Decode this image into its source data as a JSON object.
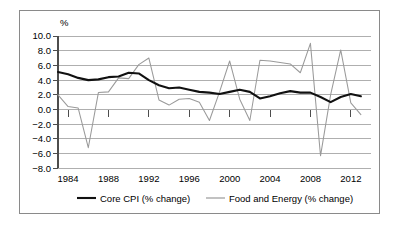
{
  "chart_data": {
    "type": "line",
    "title": "",
    "xlabel": "",
    "ylabel": "%",
    "y_unit_label": "%",
    "xlim": [
      1983,
      2014
    ],
    "ylim": [
      -8.0,
      10.0
    ],
    "grid": true,
    "legend_position": "bottom",
    "x_tick_labels": [
      "1984",
      "1988",
      "1992",
      "1996",
      "2000",
      "2004",
      "2008",
      "2012"
    ],
    "x_tick_values": [
      1984,
      1988,
      1992,
      1996,
      2000,
      2004,
      2008,
      2012
    ],
    "y_tick_labels": [
      "10.0",
      "8.0",
      "6.0",
      "4.0",
      "2.0",
      "0.0",
      "−2.0",
      "−4.0",
      "−6.0",
      "−8.0"
    ],
    "y_tick_values": [
      10.0,
      8.0,
      6.0,
      4.0,
      2.0,
      0.0,
      -2.0,
      -4.0,
      -6.0,
      -8.0
    ],
    "x": [
      1983,
      1984,
      1985,
      1986,
      1987,
      1988,
      1989,
      1990,
      1991,
      1992,
      1993,
      1994,
      1995,
      1996,
      1997,
      1998,
      1999,
      2000,
      2001,
      2002,
      2003,
      2004,
      2005,
      2006,
      2007,
      2008,
      2009,
      2010,
      2011,
      2012,
      2013
    ],
    "series": [
      {
        "name": "Core CPI (% change)",
        "color": "#111111",
        "style": "thick-black",
        "values": [
          5.1,
          4.8,
          4.3,
          4.0,
          4.1,
          4.4,
          4.5,
          5.0,
          4.9,
          4.0,
          3.3,
          2.9,
          3.0,
          2.7,
          2.4,
          2.3,
          2.1,
          2.4,
          2.7,
          2.4,
          1.5,
          1.8,
          2.2,
          2.5,
          2.3,
          2.3,
          1.7,
          1.0,
          1.7,
          2.1,
          1.8
        ]
      },
      {
        "name": "Food and Energy (% change)",
        "color": "#9a9a9a",
        "style": "thin-gray",
        "values": [
          2.0,
          0.4,
          0.2,
          -5.2,
          2.3,
          2.4,
          4.3,
          4.2,
          6.1,
          7.0,
          1.3,
          0.6,
          1.4,
          1.5,
          1.0,
          -1.5,
          2.4,
          6.6,
          1.4,
          -1.5,
          6.7,
          6.6,
          6.4,
          6.2,
          5.0,
          9.0,
          -6.3,
          2.0,
          8.1,
          0.9,
          -0.7
        ]
      }
    ],
    "legend": [
      {
        "label": "Core CPI (% change)",
        "color": "#111111"
      },
      {
        "label": "Food and Energy (% change)",
        "color": "#9a9a9a"
      }
    ]
  },
  "axes": {
    "y_unit": "%",
    "y_labels": {
      "t0": "10.0",
      "t1": "8.0",
      "t2": "6.0",
      "t3": "4.0",
      "t4": "2.0",
      "t5": "0.0",
      "t6": "−2.0",
      "t7": "−4.0",
      "t8": "−6.0",
      "t9": "−8.0"
    },
    "x_labels": {
      "t0": "1984",
      "t1": "1988",
      "t2": "1992",
      "t3": "1996",
      "t4": "2000",
      "t5": "2004",
      "t6": "2008",
      "t7": "2012"
    }
  },
  "legend": {
    "core_label": "Core CPI (% change)",
    "food_label": "Food and Energy (% change)"
  },
  "colors": {
    "core_series": "#111111",
    "food_series": "#9a9a9a",
    "gridline": "#a6a6a6",
    "frame": "#8a8a8a",
    "background": "#ffffff"
  }
}
